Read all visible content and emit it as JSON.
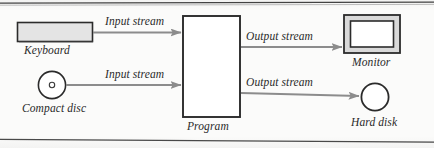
{
  "figure": {
    "type": "block-flow-diagram",
    "title": "",
    "background_color": "#fbfbfa",
    "ink_color": "#2a2a2a",
    "arrow_color": "#8c8c8c",
    "fill_gray": "#e2e2e2"
  },
  "nodes": [
    {
      "id": "keyboard",
      "label": "Keyboard",
      "shape": "filled-rectangle",
      "label_position": "below"
    },
    {
      "id": "compact-disc",
      "label": "Compact disc",
      "shape": "circle-with-hub",
      "label_position": "below"
    },
    {
      "id": "program",
      "label": "Program",
      "shape": "tall-rectangle",
      "label_position": "below"
    },
    {
      "id": "monitor",
      "label": "Monitor",
      "shape": "nested-rectangle",
      "label_position": "below"
    },
    {
      "id": "hard-disk",
      "label": "Hard disk",
      "shape": "circle",
      "label_position": "below"
    }
  ],
  "edges": [
    {
      "id": "keyboard-to-program",
      "label": "Input stream",
      "from": "keyboard",
      "to": "program",
      "direction": "right"
    },
    {
      "id": "compact-disc-to-program",
      "label": "Input stream",
      "from": "compact-disc",
      "to": "program",
      "direction": "right"
    },
    {
      "id": "program-to-monitor",
      "label": "Output stream",
      "from": "program",
      "to": "monitor",
      "direction": "right"
    },
    {
      "id": "program-to-hard-disk",
      "label": "Output stream",
      "from": "program",
      "to": "hard-disk",
      "direction": "right"
    }
  ]
}
